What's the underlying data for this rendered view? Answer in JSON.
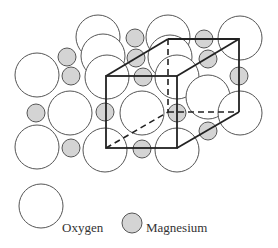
{
  "figure": {
    "type": "crystal-structure",
    "colors": {
      "oxygen_fill": "#ffffff",
      "magnesium_fill": "#d4d4d4",
      "outline": "#555555",
      "cube_edges": "#222222"
    },
    "oxygen_radius": 22,
    "magnesium_radius": 9,
    "oxygen_atoms": [
      [
        98,
        37
      ],
      [
        168,
        37
      ],
      [
        240,
        38
      ],
      [
        103,
        56
      ],
      [
        170,
        57
      ],
      [
        37,
        75
      ],
      [
        107,
        77
      ],
      [
        177,
        77
      ],
      [
        70,
        113
      ],
      [
        142,
        113
      ],
      [
        208,
        97
      ],
      [
        240,
        113
      ],
      [
        37,
        147
      ],
      [
        105,
        150
      ],
      [
        177,
        150
      ]
    ],
    "magnesium_atoms": [
      [
        67,
        57
      ],
      [
        71,
        76
      ],
      [
        135,
        38
      ],
      [
        136,
        58
      ],
      [
        143,
        77
      ],
      [
        204,
        39
      ],
      [
        208,
        59
      ],
      [
        239,
        76
      ],
      [
        36,
        113
      ],
      [
        105,
        112
      ],
      [
        177,
        113
      ],
      [
        71,
        148
      ],
      [
        208,
        131
      ],
      [
        142,
        149
      ]
    ],
    "unit_cell": {
      "front_face": {
        "x1": 106,
        "y1": 76,
        "x2": 177,
        "y2": 148
      },
      "back_face": {
        "x1": 168,
        "y1": 39,
        "x2": 239,
        "y2": 112
      }
    }
  },
  "legend": {
    "oxygen_label": "Oxygen",
    "magnesium_label": "Magnesium"
  }
}
